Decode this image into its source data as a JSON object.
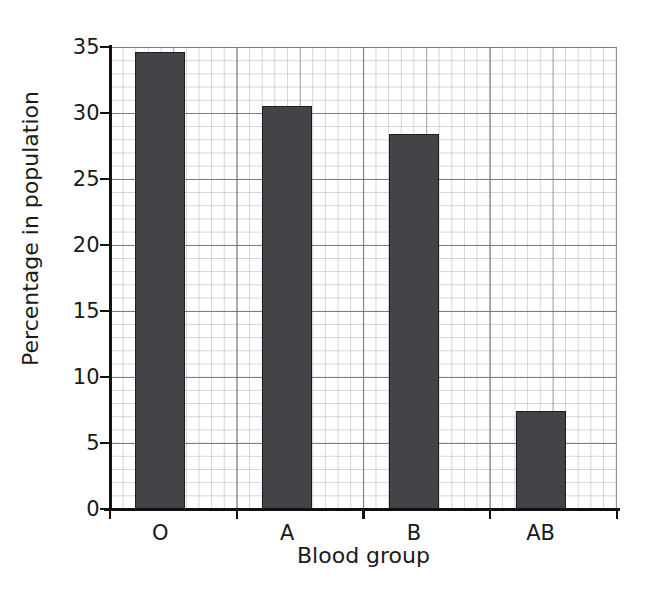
{
  "chart_data": {
    "type": "bar",
    "title": "",
    "xlabel": "Blood group",
    "ylabel": "Percentage in population",
    "categories": [
      "O",
      "A",
      "B",
      "AB"
    ],
    "values": [
      34.6,
      30.5,
      28.4,
      7.4
    ],
    "ylim": [
      0,
      35
    ],
    "ytick_labels": [
      "0",
      "5",
      "10",
      "15",
      "20",
      "25",
      "30",
      "35"
    ],
    "ytick_values": [
      0,
      5,
      10,
      15,
      20,
      25,
      30,
      35
    ],
    "grid": true,
    "grid_style": "graph-paper minor and major gridlines",
    "legend": "none",
    "bar_color": "#444448",
    "bar_edge_color": "#1d1d20",
    "axis_color": "#111111",
    "background_color": "#ffffff"
  }
}
